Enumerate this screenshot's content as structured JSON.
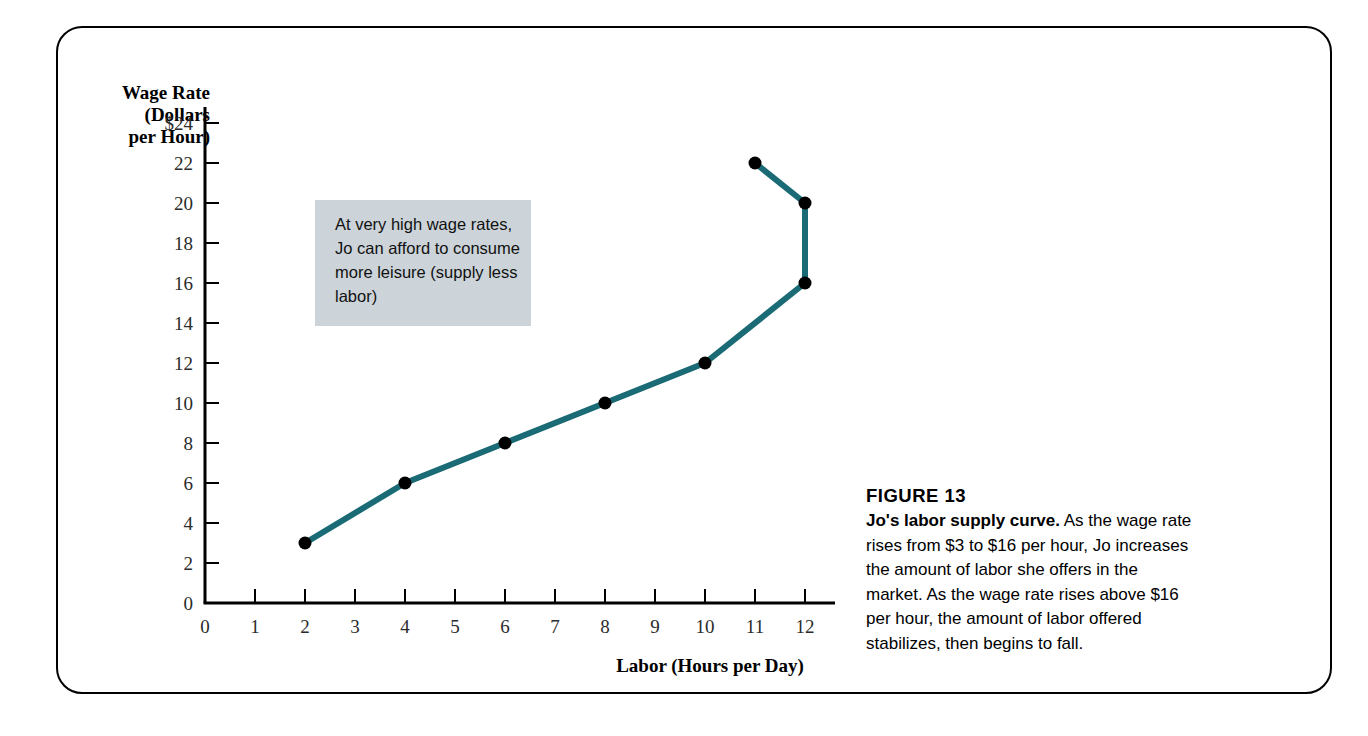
{
  "figure": {
    "number_label": "FIGURE 13",
    "caption_lead": "Jo's labor supply curve.",
    "caption_body": " As the wage rate rises from $3 to $16 per hour, Jo increases the amount of labor she offers in the market. As the wage rate rises above $16 per hour, the amount of labor offered stabilizes, then begins to fall."
  },
  "annotation": {
    "text": "At very high wage rates, Jo can afford to consume more  leisure (supply less labor)",
    "background_color": "#ccd4d9"
  },
  "colors": {
    "curve": "#1a6b75",
    "marker": "#000000",
    "axis": "#000000",
    "tick_text": "#2b2b2b",
    "frame": "#000000"
  },
  "chart_data": {
    "type": "line",
    "title": "",
    "xlabel": "Labor (Hours per Day)",
    "ylabel": "Wage Rate\n(Dollars\nper Hour)",
    "xlim": [
      0,
      12.8
    ],
    "ylim": [
      0,
      24
    ],
    "grid": false,
    "legend": "none",
    "xticks": [
      0,
      1,
      2,
      3,
      4,
      5,
      6,
      7,
      8,
      9,
      10,
      11,
      12
    ],
    "xticklabels": [
      "0",
      "1",
      "2",
      "3",
      "4",
      "5",
      "6",
      "7",
      "8",
      "9",
      "10",
      "11",
      "12"
    ],
    "yticks": [
      0,
      2,
      4,
      6,
      8,
      10,
      12,
      14,
      16,
      18,
      20,
      22,
      24
    ],
    "yticklabels": [
      "0",
      "2",
      "4",
      "6",
      "8",
      "10",
      "12",
      "14",
      "16",
      "18",
      "20",
      "22",
      "$24"
    ],
    "series": [
      {
        "name": "Jo's labor supply curve",
        "marker": "filled-circle",
        "points": [
          {
            "x": 2,
            "y": 3
          },
          {
            "x": 4,
            "y": 6
          },
          {
            "x": 6,
            "y": 8
          },
          {
            "x": 8,
            "y": 10
          },
          {
            "x": 10,
            "y": 12
          },
          {
            "x": 12,
            "y": 16
          },
          {
            "x": 12,
            "y": 20
          },
          {
            "x": 11,
            "y": 22
          }
        ]
      }
    ],
    "annotations": [
      {
        "text": "At very high wage rates, Jo can afford to consume more  leisure (supply less labor)",
        "x_range": [
          2.1,
          6.1
        ],
        "y_range": [
          14.4,
          20.6
        ]
      }
    ]
  }
}
